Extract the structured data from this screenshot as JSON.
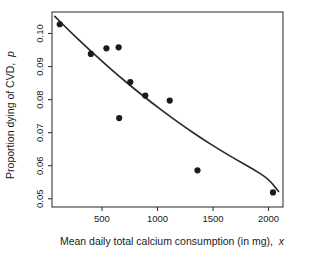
{
  "chart_data": {
    "type": "scatter",
    "title": "",
    "xlabel": "Mean daily total calcium consumption (in mg), x",
    "xlabel_plain": "Mean daily total calcium consumption (in mg),",
    "xlabel_italic": "x",
    "ylabel": "Proportion dying of CVD, p",
    "ylabel_plain": "Proportion dying of CVD,",
    "ylabel_italic": "p",
    "xlim": [
      50,
      2130
    ],
    "ylim": [
      0.0475,
      0.1065
    ],
    "xticks": [
      500,
      1000,
      1500,
      2000
    ],
    "xtick_labels": [
      "500",
      "1000",
      "1500",
      "2000"
    ],
    "yticks": [
      0.05,
      0.06,
      0.07,
      0.08,
      0.09,
      0.1
    ],
    "ytick_labels": [
      "0.05",
      "0.06",
      "0.07",
      "0.08",
      "0.09",
      "0.10"
    ],
    "grid": false,
    "legend": false,
    "x": [
      120,
      400,
      540,
      650,
      655,
      755,
      890,
      1110,
      1360,
      2040
    ],
    "y": [
      0.1028,
      0.0938,
      0.0955,
      0.0958,
      0.0744,
      0.0853,
      0.0812,
      0.0797,
      0.0586,
      0.0519
    ],
    "points": [
      {
        "x": 120,
        "y": 0.1028
      },
      {
        "x": 400,
        "y": 0.0938
      },
      {
        "x": 540,
        "y": 0.0955
      },
      {
        "x": 650,
        "y": 0.0958
      },
      {
        "x": 655,
        "y": 0.0744
      },
      {
        "x": 755,
        "y": 0.0853
      },
      {
        "x": 890,
        "y": 0.0812
      },
      {
        "x": 1110,
        "y": 0.0797
      },
      {
        "x": 1360,
        "y": 0.0586
      },
      {
        "x": 2040,
        "y": 0.0519
      }
    ],
    "series": [
      {
        "name": "observed proportions",
        "marker": "filled-circle",
        "color": "#1a1a1a",
        "values": [
          0.1028,
          0.0938,
          0.0955,
          0.0958,
          0.0744,
          0.0853,
          0.0812,
          0.0797,
          0.0586,
          0.0519
        ]
      },
      {
        "name": "fitted curve",
        "marker": "line",
        "color": "#2b2b2b",
        "curve_points": [
          {
            "x": 75,
            "y": 0.1052
          },
          {
            "x": 200,
            "y": 0.101
          },
          {
            "x": 350,
            "y": 0.0962
          },
          {
            "x": 500,
            "y": 0.0916
          },
          {
            "x": 650,
            "y": 0.0872
          },
          {
            "x": 800,
            "y": 0.083
          },
          {
            "x": 950,
            "y": 0.079
          },
          {
            "x": 1100,
            "y": 0.0752
          },
          {
            "x": 1250,
            "y": 0.0716
          },
          {
            "x": 1400,
            "y": 0.0682
          },
          {
            "x": 1550,
            "y": 0.065
          },
          {
            "x": 1700,
            "y": 0.062
          },
          {
            "x": 1850,
            "y": 0.0592
          },
          {
            "x": 2000,
            "y": 0.056
          },
          {
            "x": 2090,
            "y": 0.0522
          }
        ]
      }
    ]
  }
}
